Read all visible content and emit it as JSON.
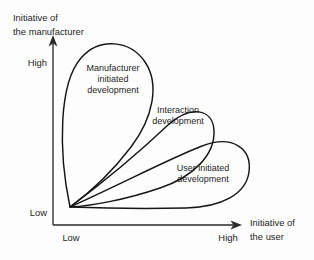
{
  "figure": {
    "background_color": "#fdfdfd",
    "line_color": "#161616",
    "axis_color": "#2a2a2a",
    "text_color": "#1d1d1d"
  },
  "axes": {
    "y_axis": {
      "title_line1": "Initiative of",
      "title_line2": "the manufacturer",
      "high_label": "High",
      "low_label": "Low",
      "arrow_icon": "arrow-up-icon"
    },
    "x_axis": {
      "title_line1": "Initiative of",
      "title_line2": "the user",
      "high_label": "High",
      "low_label": "Low",
      "arrow_icon": "arrow-right-icon"
    }
  },
  "regions": [
    {
      "id": "manufacturer-initiated-development",
      "line1": "Manufacturer",
      "line2": "initiated",
      "line3": "development"
    },
    {
      "id": "interaction-development",
      "line1": "Interaction",
      "line2": "development",
      "line3": ""
    },
    {
      "id": "user-initiated-development",
      "line1": "User initiated",
      "line2": "development",
      "line3": ""
    }
  ]
}
